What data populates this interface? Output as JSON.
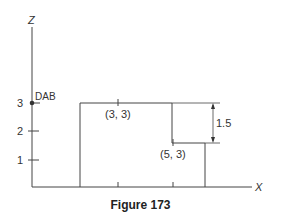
{
  "figure": {
    "caption": "Figure 173",
    "axes": {
      "x_label": "X",
      "z_label": "Z",
      "z_ticks": [
        "1",
        "2",
        "3"
      ]
    },
    "points": {
      "origin_marker_label": "DAB",
      "upper_step_label": "(3, 3)",
      "lower_step_label": "(5, 3)"
    },
    "dimension": {
      "step_height_label": "1.5"
    }
  }
}
